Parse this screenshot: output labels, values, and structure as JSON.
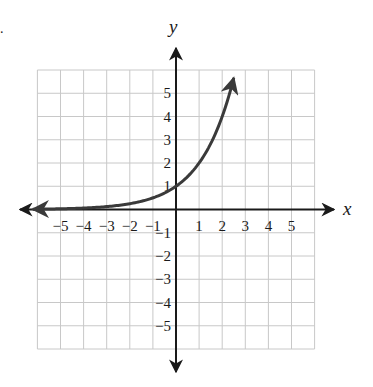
{
  "problem_marker": ".",
  "chart_data": {
    "type": "line",
    "title": "",
    "function": "y = 2^x",
    "xlabel": "x",
    "ylabel": "y",
    "xlim": [
      -6,
      6
    ],
    "ylim": [
      -6,
      6
    ],
    "grid": true,
    "x_tick_labels": [
      "-5",
      "-4",
      "-3",
      "-2",
      "-1",
      "1",
      "2",
      "3",
      "4",
      "5"
    ],
    "y_tick_labels": [
      "5",
      "4",
      "3",
      "2",
      "1",
      "-1",
      "-2",
      "-3",
      "-4",
      "-5"
    ],
    "series": [
      {
        "name": "exponential curve",
        "x": [
          -6.5,
          -5,
          -4,
          -3,
          -2,
          -1,
          0,
          1,
          1.5,
          2,
          2.5
        ],
        "values": [
          0.011,
          0.031,
          0.063,
          0.125,
          0.25,
          0.5,
          1,
          2,
          2.83,
          4,
          5.66
        ],
        "color": "#3a3a3a",
        "arrows": "both ends"
      }
    ],
    "axis_arrows": true,
    "legend": null
  },
  "colors": {
    "grid": "#c8c8c8",
    "axis": "#1a1a1a",
    "curve": "#3a3a3a"
  }
}
